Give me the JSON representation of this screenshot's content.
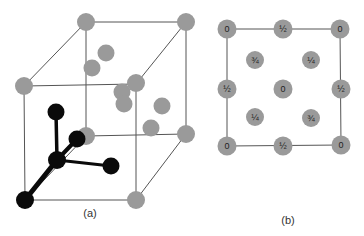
{
  "figure": {
    "panel_a": {
      "caption": "(a)",
      "description": "3D cubic unit cell with gray atoms at corners and interior; black atoms showing tetrahedral bonding",
      "colors": {
        "gray_atom": "#9a9a9a",
        "black_atom": "#0a0a0a",
        "edge": "#555555"
      }
    },
    "panel_b": {
      "caption": "(b)",
      "description": "Plan view projection with fractional heights",
      "atoms": [
        {
          "pos": "top-left-corner",
          "label": "0"
        },
        {
          "pos": "top-mid",
          "label": "½"
        },
        {
          "pos": "top-right-corner",
          "label": "0"
        },
        {
          "pos": "inner-upper-left",
          "label": "¾"
        },
        {
          "pos": "inner-upper-right",
          "label": "¼"
        },
        {
          "pos": "left-mid",
          "label": "½"
        },
        {
          "pos": "center",
          "label": "0"
        },
        {
          "pos": "right-mid",
          "label": "½"
        },
        {
          "pos": "inner-lower-left",
          "label": "¼"
        },
        {
          "pos": "inner-lower-right",
          "label": "¾"
        },
        {
          "pos": "bottom-left-corner",
          "label": "0"
        },
        {
          "pos": "bottom-mid",
          "label": "½"
        },
        {
          "pos": "bottom-right-corner",
          "label": "0"
        }
      ]
    }
  }
}
